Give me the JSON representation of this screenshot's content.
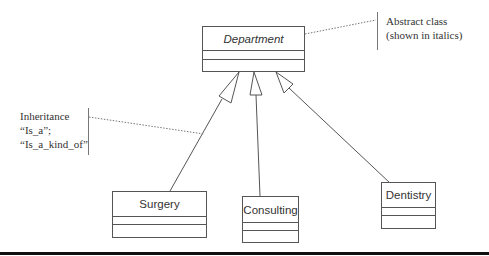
{
  "diagram": {
    "type": "UML class diagram (inheritance)",
    "classes": [
      {
        "id": "department",
        "name": "Department",
        "abstract": true
      },
      {
        "id": "surgery",
        "name": "Surgery",
        "abstract": false
      },
      {
        "id": "consulting",
        "name": "Consulting",
        "abstract": false
      },
      {
        "id": "dentistry",
        "name": "Dentistry",
        "abstract": false
      }
    ],
    "relationships": [
      {
        "type": "generalization",
        "from": "surgery",
        "to": "department"
      },
      {
        "type": "generalization",
        "from": "consulting",
        "to": "department"
      },
      {
        "type": "generalization",
        "from": "dentistry",
        "to": "department"
      }
    ]
  },
  "annotations": {
    "abstract_note": {
      "line1": "Abstract class",
      "line2": "(shown in italics)"
    },
    "inheritance_note": {
      "line1": "Inheritance",
      "line2": "“Is_a”;",
      "line3": "“Is_a_kind_of”"
    }
  },
  "colors": {
    "line": "#555555",
    "text": "#333333",
    "rule": "#111111"
  }
}
